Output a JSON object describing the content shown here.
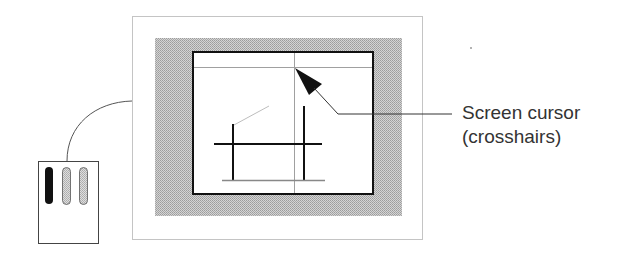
{
  "figure": {
    "type": "diagram",
    "description_components": [
      "monitor",
      "screen",
      "drawing",
      "crosshair-cursor",
      "mouse",
      "cable",
      "callout-label"
    ],
    "callout": {
      "line1": "Screen cursor",
      "line2": "(crosshairs)"
    },
    "colors": {
      "frame_stroke": "#c8c8c8",
      "bezel_fill": "#b9b9b9",
      "screen_border": "#111111",
      "crosshair": "#9a9a9a",
      "drawing_stroke": "#111111",
      "drawing_light": "#bbbbbb",
      "mouse_button_active": "#111111",
      "mouse_button_inactive": "#c4c4c4",
      "text": "#333333"
    },
    "mouse": {
      "buttons": [
        {
          "name": "left",
          "state": "active"
        },
        {
          "name": "middle",
          "state": "inactive"
        },
        {
          "name": "right",
          "state": "inactive"
        }
      ]
    }
  }
}
